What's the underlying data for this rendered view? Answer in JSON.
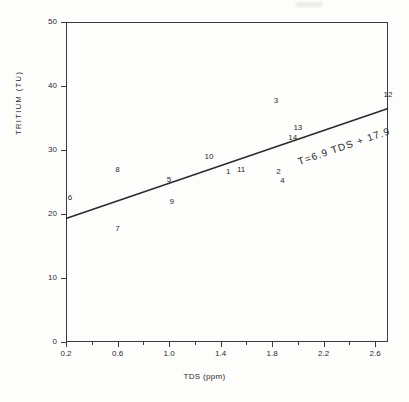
{
  "chart_data": {
    "type": "scatter",
    "title": "",
    "xlabel": "TDS (ppm)",
    "ylabel": "TRITIUM (TU)",
    "xlim": [
      0.2,
      2.7
    ],
    "ylim": [
      0,
      50
    ],
    "grid": false,
    "legend": "none",
    "xticks": [
      "0.2",
      "0.6",
      "1.0",
      "1.4",
      "1.8",
      "2.2",
      "2.6"
    ],
    "xtick_values": [
      0.2,
      0.6,
      1.0,
      1.4,
      1.8,
      2.2,
      2.6
    ],
    "xminor_values": [
      0.4,
      0.8,
      1.2,
      1.6,
      2.0,
      2.4
    ],
    "yticks": [
      "0",
      "10",
      "20",
      "30",
      "40",
      "50"
    ],
    "ytick_values": [
      0,
      10,
      20,
      30,
      40,
      50
    ],
    "annotation": "T=6.9 TDS + 17.9",
    "fit": {
      "name": "regression line",
      "slope": 6.9,
      "intercept": 17.9,
      "x_start": 0.2,
      "y_start": 19.3,
      "x_end": 2.7,
      "y_end": 36.5
    },
    "point_labels": [
      "1",
      "2",
      "3",
      "4",
      "5",
      "6",
      "7",
      "8",
      "9",
      "10",
      "11",
      "12",
      "13",
      "14"
    ],
    "points": [
      {
        "label": "1",
        "x": 1.46,
        "y": 26.6
      },
      {
        "label": "2",
        "x": 1.85,
        "y": 26.6
      },
      {
        "label": "3",
        "x": 1.83,
        "y": 37.6
      },
      {
        "label": "4",
        "x": 1.88,
        "y": 25.1
      },
      {
        "label": "5",
        "x": 1.0,
        "y": 25.3
      },
      {
        "label": "6",
        "x": 0.23,
        "y": 22.5
      },
      {
        "label": "7",
        "x": 0.6,
        "y": 17.6
      },
      {
        "label": "8",
        "x": 0.6,
        "y": 26.8
      },
      {
        "label": "9",
        "x": 1.02,
        "y": 21.8
      },
      {
        "label": "10",
        "x": 1.31,
        "y": 28.9
      },
      {
        "label": "11",
        "x": 1.56,
        "y": 26.9
      },
      {
        "label": "12",
        "x": 2.7,
        "y": 38.6
      },
      {
        "label": "13",
        "x": 2.0,
        "y": 33.5
      },
      {
        "label": "14",
        "x": 1.96,
        "y": 31.9
      }
    ]
  },
  "figure": {
    "background_color": "#fdfdfb",
    "ink_color": "#2b2b2b"
  }
}
